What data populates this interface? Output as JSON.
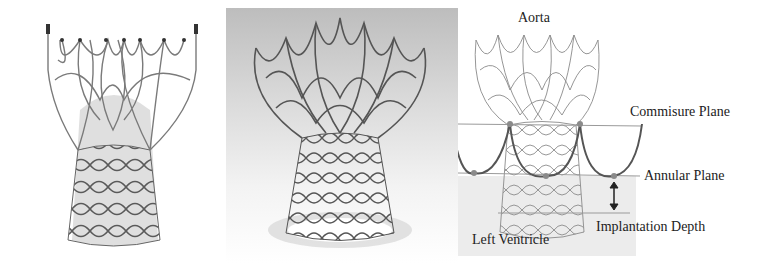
{
  "figure": {
    "panels": [
      {
        "id": "left",
        "description": "Self-expanding transcatheter valve stent with leaflet tissue"
      },
      {
        "id": "middle",
        "description": "Nitinol frame rendering with flared top"
      },
      {
        "id": "right",
        "description": "Schematic of valve frame placement"
      }
    ],
    "labels": {
      "aorta": "Aorta",
      "commissure_plane": "Commisure Plane",
      "annular_plane": "Annular Plane",
      "implantation_depth": "Implantation Depth",
      "left_ventricle": "Left Ventricle"
    },
    "colors": {
      "frame": "#6b6b6b",
      "cusp_curve": "#555555",
      "plane_line": "#9a9a9a",
      "marker_dot": "#8a8a8a",
      "ventricle_shade": "#ececec"
    }
  }
}
